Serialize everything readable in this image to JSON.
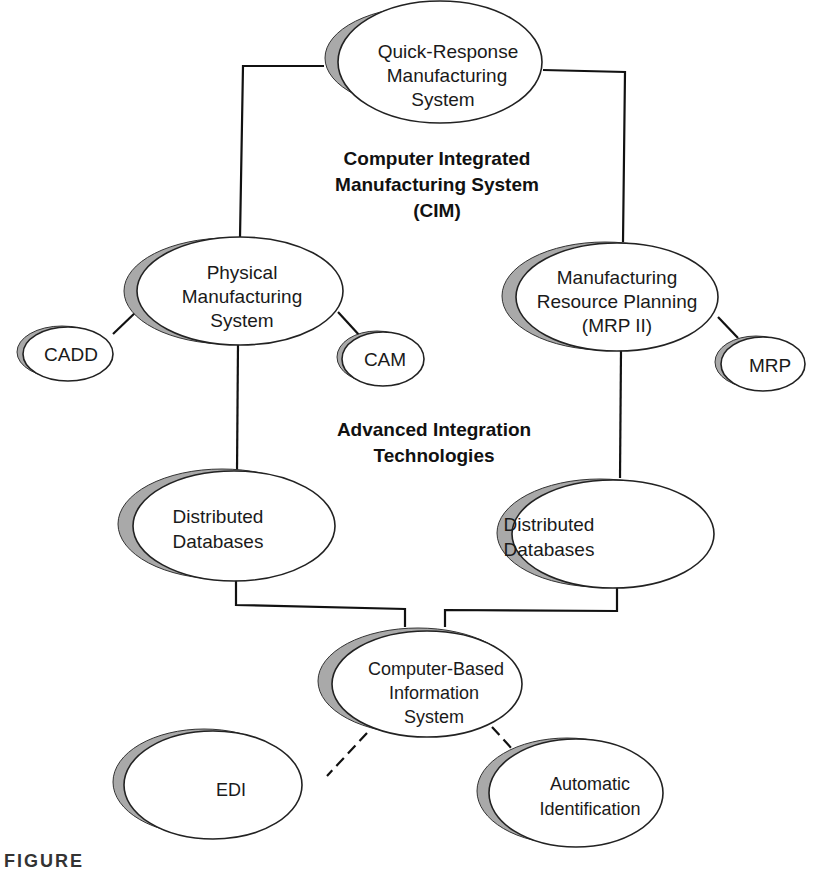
{
  "diagram": {
    "type": "concept-map",
    "group_labels": {
      "cim": [
        "Computer Integrated",
        "Manufacturing System",
        "(CIM)"
      ],
      "ait": [
        "Advanced Integration",
        "Technologies"
      ]
    },
    "nodes": {
      "qrm": [
        "Quick-Response",
        "Manufacturing",
        "System"
      ],
      "pms": [
        "Physical",
        "Manufacturing",
        "System"
      ],
      "cadd": [
        "CADD"
      ],
      "cam": [
        "CAM"
      ],
      "mrp2": [
        "Manufacturing",
        "Resource Planning",
        "(MRP II)"
      ],
      "mrp": [
        "MRP"
      ],
      "db_left": [
        "Distributed",
        "Databases"
      ],
      "db_right": [
        "Distributed",
        "Databases"
      ],
      "cbis": [
        "Computer-Based",
        "Information",
        "System"
      ],
      "edi": [
        "EDI"
      ],
      "autoid": [
        "Automatic",
        "Identification"
      ]
    },
    "edges": [
      {
        "from": "qrm",
        "to": "pms",
        "style": "solid"
      },
      {
        "from": "qrm",
        "to": "mrp2",
        "style": "solid"
      },
      {
        "from": "pms",
        "to": "cadd",
        "style": "solid"
      },
      {
        "from": "pms",
        "to": "cam",
        "style": "solid"
      },
      {
        "from": "mrp2",
        "to": "mrp",
        "style": "solid"
      },
      {
        "from": "pms",
        "to": "db_left",
        "style": "solid"
      },
      {
        "from": "mrp2",
        "to": "db_right",
        "style": "solid"
      },
      {
        "from": "db_left",
        "to": "cbis",
        "style": "solid"
      },
      {
        "from": "db_right",
        "to": "cbis",
        "style": "solid"
      },
      {
        "from": "cbis",
        "to": "edi",
        "style": "dashed"
      },
      {
        "from": "cbis",
        "to": "autoid",
        "style": "dashed"
      }
    ],
    "colors": {
      "line": "#111111",
      "oval_fill": "#ffffff",
      "shadow": "#a9a9a9"
    }
  },
  "caption_partial": "FIGURE"
}
